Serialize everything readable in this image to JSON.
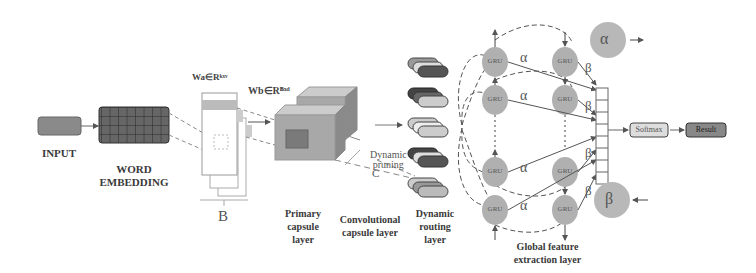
{
  "diagram": {
    "colors": {
      "box_fill": "#8a8a8a",
      "grid_fill": "#5a5a5a",
      "cube_fill": "#a8a8a8",
      "gru_fill": "#b0b0b0",
      "line": "#555555"
    },
    "labels": {
      "input": "INPUT",
      "word_embedding": "WORD\nEMBEDDING",
      "b_bracket": "B",
      "wa": "Wa∈Rᵏˣᵛ",
      "wb": "Wb∈Rᴮˣᵈ",
      "primary_capsule": "Primary\ncapsule\nlayer",
      "conv_capsule": "Convolutional\ncapsule layer",
      "dynamic_pruning": "Dynamic\npruning",
      "c_label": "C",
      "dynamic_routing": "Dynamic\nrouting\nlayer",
      "global_feature": "Global feature\nextraction layer",
      "softmax": "Softmax",
      "result": "Result",
      "alpha": "α",
      "beta": "β",
      "gru": "GRU"
    },
    "gru_nodes": [
      "GRU",
      "GRU",
      "GRU",
      "GRU",
      "GRU",
      "GRU",
      "GRU",
      "GRU"
    ],
    "weights": {
      "left_column": [
        "α",
        "α",
        "α",
        "α"
      ],
      "right_column": [
        "β",
        "β",
        "β",
        "β"
      ]
    },
    "legend_circles": [
      "α",
      "β"
    ]
  }
}
